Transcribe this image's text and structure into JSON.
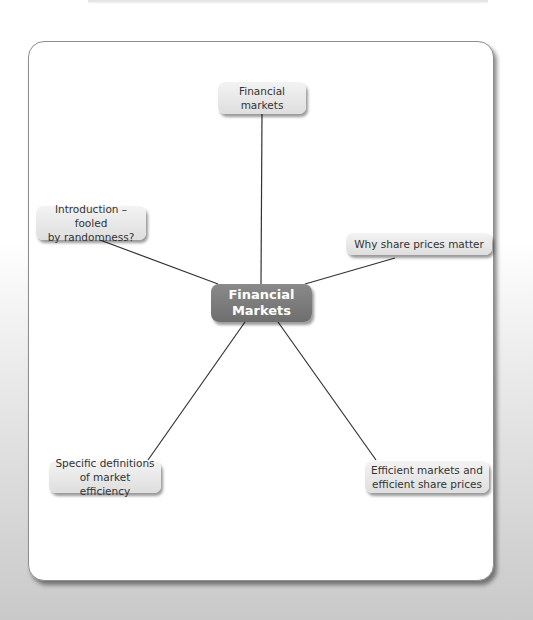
{
  "diagram": {
    "type": "mind-map",
    "center": {
      "label": "Financial\nMarkets",
      "line1": "Financial",
      "line2": "Markets"
    },
    "nodes": [
      {
        "id": "top",
        "line1": "Financial",
        "line2": "markets"
      },
      {
        "id": "upper-left",
        "line1": "Introduction – fooled",
        "line2": "by randomness?"
      },
      {
        "id": "right",
        "line1": "Why share prices matter",
        "line2": ""
      },
      {
        "id": "lower-left",
        "line1": "Specific definitions",
        "line2": "of market efficiency"
      },
      {
        "id": "lower-right",
        "line1": "Efficient markets and",
        "line2": "efficient share prices"
      }
    ],
    "colors": {
      "center_fill": "#7a7a7a",
      "node_fill": "#e8e8e8",
      "line": "#333333",
      "card_border": "#8e8e8e"
    }
  }
}
